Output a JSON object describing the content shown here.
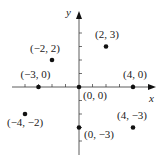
{
  "chart_data": {
    "type": "scatter",
    "title": "",
    "xlabel": "x",
    "ylabel": "y",
    "xlim": [
      -5,
      5
    ],
    "ylim": [
      -4,
      4
    ],
    "grid": false,
    "legend": null,
    "points": [
      {
        "x": -2,
        "y": 2,
        "label": "(−2, 2)"
      },
      {
        "x": 2,
        "y": 3,
        "label": "(2, 3)"
      },
      {
        "x": -3,
        "y": 0,
        "label": "(−3, 0)"
      },
      {
        "x": 0,
        "y": 0,
        "label": "(0, 0)"
      },
      {
        "x": 4,
        "y": 0,
        "label": "(4, 0)"
      },
      {
        "x": -4,
        "y": -2,
        "label": "(−4, −2)"
      },
      {
        "x": 0,
        "y": -3,
        "label": "(0, −3)"
      },
      {
        "x": 4,
        "y": -3,
        "label": "(4, −3)"
      }
    ]
  },
  "axes": {
    "x_label": "x",
    "y_label": "y",
    "color": "#333333"
  },
  "style": {
    "point_color": "#111111",
    "text_color": "#222222"
  }
}
